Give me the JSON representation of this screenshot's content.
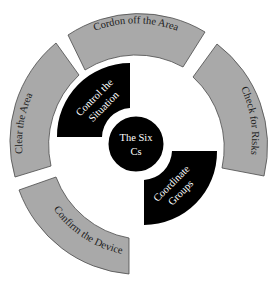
{
  "diagram": {
    "center": {
      "label_line1": "The Six",
      "label_line2": "Cs"
    },
    "inner_segments": [
      {
        "id": "control",
        "line1": "Control the",
        "line2": "Situation",
        "color": "#000000"
      },
      {
        "id": "coordinate",
        "line1": "Coordinate",
        "line2": "Groups",
        "color": "#000000"
      }
    ],
    "outer_segments": [
      {
        "id": "cordon",
        "label": "Cordon off the Area",
        "color": "#a9a9a9"
      },
      {
        "id": "check",
        "label": "Check for Risks",
        "color": "#a9a9a9"
      },
      {
        "id": "confirm",
        "label": "Confirm the Device",
        "color": "#a9a9a9"
      },
      {
        "id": "clear",
        "label": "Clear the Area",
        "color": "#a9a9a9"
      }
    ]
  }
}
